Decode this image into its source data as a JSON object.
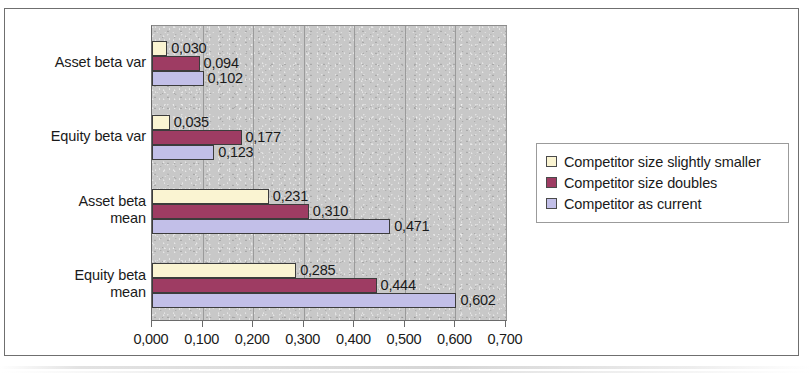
{
  "chart_data": {
    "type": "bar",
    "orientation": "horizontal",
    "title": "",
    "xlabel": "",
    "ylabel": "",
    "categories": [
      "Asset beta var",
      "Equity beta var",
      "Asset beta mean",
      "Equity beta mean"
    ],
    "series": [
      {
        "name": "Competitor size slightly smaller",
        "color": "#faf4d2",
        "values": [
          0.03,
          0.035,
          0.231,
          0.285
        ]
      },
      {
        "name": "Competitor size doubles",
        "color": "#9e3c63",
        "values": [
          0.094,
          0.177,
          0.31,
          0.444
        ]
      },
      {
        "name": "Competitor as current",
        "color": "#c2bfe8",
        "values": [
          0.102,
          0.123,
          0.471,
          0.602
        ]
      }
    ],
    "data_labels": [
      [
        "0,030",
        "0,035",
        "0,231",
        "0,285"
      ],
      [
        "0,094",
        "0,177",
        "0,310",
        "0,444"
      ],
      [
        "0,102",
        "0,123",
        "0,471",
        "0,602"
      ]
    ],
    "xlim": [
      0.0,
      0.7
    ],
    "xticks": [
      0.0,
      0.1,
      0.2,
      0.3,
      0.4,
      0.5,
      0.6,
      0.7
    ],
    "xtick_labels": [
      "0,000",
      "0,100",
      "0,200",
      "0,300",
      "0,400",
      "0,500",
      "0,600",
      "0,700"
    ],
    "grid": true,
    "grid_axis": "x",
    "legend_position": "right",
    "plot_background": "#c8c8c8",
    "decimal_separator": ","
  },
  "legend": {
    "items": [
      {
        "label": "Competitor size slightly smaller",
        "color": "#faf4d2"
      },
      {
        "label": "Competitor size doubles",
        "color": "#9e3c63"
      },
      {
        "label": "Competitor as current",
        "color": "#c2bfe8"
      }
    ]
  }
}
